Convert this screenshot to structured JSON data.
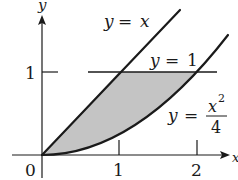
{
  "diagram": {
    "axes": {
      "x_label": "x",
      "y_label": "y",
      "origin_label": "0",
      "x_ticks": [
        "1",
        "2"
      ],
      "y_ticks": [
        "1"
      ]
    },
    "curves": [
      {
        "name": "line-y-equals-x",
        "label_lhs": "y",
        "label_eq": "=",
        "label_rhs": "x"
      },
      {
        "name": "line-y-equals-1",
        "label_lhs": "y",
        "label_eq": "=",
        "label_rhs": "1"
      },
      {
        "name": "parabola-y-equals-x2-over-4",
        "label_lhs": "y",
        "label_eq": "=",
        "numerator": "x",
        "exponent": "2",
        "denominator": "4"
      }
    ],
    "shaded_region": {
      "description": "Region bounded by y = x, y = 1 and y = x^2/4",
      "fill_color": "#c4c4c4"
    },
    "colors": {
      "stroke": "#1a1a1a",
      "shade": "#c4c4c4",
      "background": "#ffffff"
    }
  }
}
